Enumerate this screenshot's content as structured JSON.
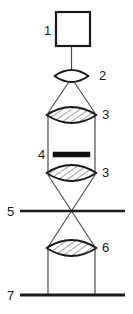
{
  "diagram": {
    "kind": "optical-ray-diagram",
    "width": 133,
    "height": 314,
    "background_color": "#ffffff",
    "stroke_color": "#1a1a1a",
    "ray_color": "#4a4a4a",
    "hatch_color": "#555555",
    "axis_center_x": 71.5,
    "components": [
      {
        "id": "1",
        "label": "1",
        "name": "light-source",
        "shape": "square-outline",
        "label_side": "left",
        "label_x": 44,
        "label_y": 35,
        "x": 56,
        "y": 12,
        "w": 34,
        "h": 34,
        "fill": "#ffffff",
        "stroke_width": 2.2
      },
      {
        "id": "2",
        "label": "2",
        "name": "collector-lens",
        "shape": "lens-plain",
        "label_side": "right",
        "label_x": 99,
        "label_y": 80,
        "cx": 71.5,
        "cy": 76,
        "half_width": 17,
        "half_height": 6,
        "hatched": false
      },
      {
        "id": "3a",
        "label": "3",
        "name": "condenser-lens-upper",
        "shape": "lens-hatched",
        "label_side": "right",
        "label_x": 102,
        "label_y": 119,
        "cx": 71.5,
        "cy": 115,
        "half_width": 25,
        "half_height": 8,
        "hatched": true
      },
      {
        "id": "4",
        "label": "4",
        "name": "specimen-bar",
        "shape": "solid-bar",
        "label_side": "left",
        "label_x": 38,
        "label_y": 159,
        "x": 53,
        "y": 152,
        "w": 37,
        "h": 5,
        "fill": "#111111"
      },
      {
        "id": "3b",
        "label": "3",
        "name": "condenser-lens-lower",
        "shape": "lens-hatched",
        "label_side": "right",
        "label_x": 102,
        "label_y": 177,
        "cx": 71.5,
        "cy": 173,
        "half_width": 25,
        "half_height": 8,
        "hatched": true
      },
      {
        "id": "5",
        "label": "5",
        "name": "intermediate-plane",
        "shape": "horizontal-rule",
        "label_side": "left",
        "label_x": 7,
        "label_y": 216,
        "x1": 20,
        "x2": 125,
        "y": 211,
        "stroke_width": 2.6
      },
      {
        "id": "6",
        "label": "6",
        "name": "projection-lens",
        "shape": "lens-hatched",
        "label_side": "right",
        "label_x": 102,
        "label_y": 252,
        "cx": 71.5,
        "cy": 248,
        "half_width": 25,
        "half_height": 8,
        "hatched": true
      },
      {
        "id": "7",
        "label": "7",
        "name": "image-plane",
        "shape": "horizontal-rule",
        "label_side": "left",
        "label_x": 7,
        "label_y": 300,
        "x1": 20,
        "x2": 125,
        "y": 295,
        "stroke_width": 3.2
      }
    ],
    "ray_segments": [
      {
        "name": "source-axis-ray",
        "x1": 71.5,
        "y1": 46,
        "x2": 71.5,
        "y2": 76,
        "width": 1.2
      },
      {
        "name": "lens2-to-lens3-left",
        "x1": 71.5,
        "y1": 78,
        "x2": 48,
        "y2": 113,
        "width": 1.1
      },
      {
        "name": "lens2-to-lens3-right",
        "x1": 71.5,
        "y1": 78,
        "x2": 95,
        "y2": 113,
        "width": 1.1
      },
      {
        "name": "tube-wall-left",
        "x1": 48,
        "y1": 115,
        "x2": 48,
        "y2": 173,
        "width": 1.2
      },
      {
        "name": "tube-wall-right",
        "x1": 95,
        "y1": 115,
        "x2": 95,
        "y2": 173,
        "width": 1.2
      },
      {
        "name": "cross-ray-left-to-right",
        "x1": 48,
        "y1": 175,
        "x2": 95,
        "y2": 247,
        "width": 1.1
      },
      {
        "name": "cross-ray-right-to-left",
        "x1": 95,
        "y1": 175,
        "x2": 48,
        "y2": 247,
        "width": 1.1
      },
      {
        "name": "lens6-to-screen-left",
        "x1": 48,
        "y1": 249,
        "x2": 48,
        "y2": 295,
        "width": 1.2
      },
      {
        "name": "lens6-to-screen-right",
        "x1": 95,
        "y1": 249,
        "x2": 95,
        "y2": 295,
        "width": 1.2
      }
    ],
    "crossover_point": {
      "x": 71.5,
      "y": 211
    }
  }
}
